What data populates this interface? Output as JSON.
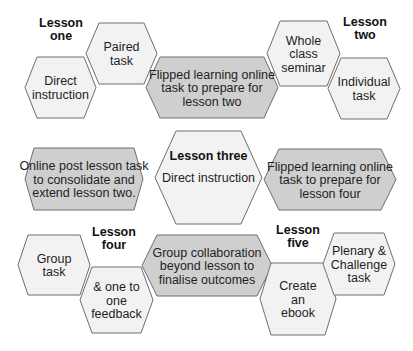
{
  "colors": {
    "light_fill": "#f2f2f2",
    "dark_fill": "#cfcfcf",
    "stroke": "#6e6e6e",
    "text": "#1e1e1e"
  },
  "lesson_labels": [
    {
      "id": "lesson-one",
      "lines": [
        "Lesson",
        "one"
      ],
      "x": 61,
      "y": 27
    },
    {
      "id": "lesson-two",
      "lines": [
        "Lesson",
        "two"
      ],
      "x": 365,
      "y": 26
    },
    {
      "id": "lesson-four",
      "lines": [
        "Lesson",
        "four"
      ],
      "x": 114,
      "y": 236
    },
    {
      "id": "lesson-five",
      "lines": [
        "Lesson",
        "five"
      ],
      "x": 298,
      "y": 234
    }
  ],
  "hexagons": [
    {
      "id": "paired-task",
      "style": "light",
      "lines": [
        "Paired",
        "task"
      ],
      "box": [
        86,
        23,
        157,
        84
      ],
      "inset": 13
    },
    {
      "id": "direct-instruction-l1",
      "style": "light",
      "lines": [
        "Direct",
        "instruction"
      ],
      "box": [
        25,
        57,
        96,
        118
      ],
      "inset": 12
    },
    {
      "id": "flipped-lesson-two",
      "style": "dark",
      "lines": [
        "Flipped learning online",
        "task to prepare for",
        "lesson two"
      ],
      "box": [
        146,
        57,
        278,
        118
      ],
      "inset": 14
    },
    {
      "id": "whole-class-seminar",
      "style": "light",
      "lines": [
        "Whole",
        "class",
        "seminar"
      ],
      "box": [
        267,
        21,
        340,
        86
      ],
      "inset": 13
    },
    {
      "id": "individual-task",
      "style": "light",
      "lines": [
        "Individual",
        "task"
      ],
      "box": [
        328,
        58,
        400,
        119
      ],
      "inset": 13
    },
    {
      "id": "online-post-lesson",
      "style": "dark",
      "lines": [
        "Online post lesson task",
        "to consolidate and",
        "extend lesson two."
      ],
      "box": [
        25,
        148,
        143,
        210
      ],
      "inset": 9
    },
    {
      "id": "lesson-three",
      "style": "light",
      "lines": [
        "Direct instruction"
      ],
      "title": "Lesson three",
      "box": [
        155,
        131,
        262,
        224
      ],
      "inset": 21
    },
    {
      "id": "flipped-lesson-four",
      "style": "dark",
      "lines": [
        "Flipped learning online",
        "task to prepare for",
        "lesson four"
      ],
      "box": [
        264,
        149,
        396,
        210
      ],
      "inset": 15
    },
    {
      "id": "group-task",
      "style": "light",
      "lines": [
        "Group",
        "task"
      ],
      "box": [
        18,
        235,
        90,
        295
      ],
      "inset": 10
    },
    {
      "id": "one-to-one-feedback",
      "style": "light",
      "lines": [
        "& one to",
        "one",
        "feedback"
      ],
      "box": [
        80,
        267,
        153,
        333
      ],
      "inset": 12
    },
    {
      "id": "group-collaboration",
      "style": "dark",
      "lines": [
        "Group collaboration",
        "beyond lesson to",
        "finalise outcomes"
      ],
      "box": [
        142,
        235,
        272,
        296
      ],
      "inset": 15
    },
    {
      "id": "create-ebook",
      "style": "light",
      "lines": [
        "Create",
        "an",
        "ebook"
      ],
      "box": [
        260,
        263,
        336,
        335
      ],
      "inset": 11
    },
    {
      "id": "plenary-challenge",
      "style": "light",
      "lines": [
        "Plenary &",
        "Challenge",
        "task"
      ],
      "box": [
        323,
        233,
        395,
        295
      ],
      "inset": 11
    }
  ]
}
